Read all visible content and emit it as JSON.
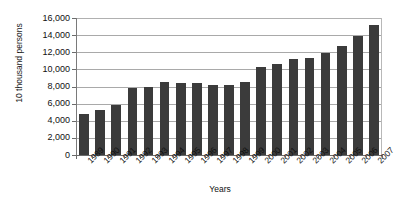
{
  "chart_data": {
    "type": "bar",
    "title": "",
    "xlabel": "Years",
    "ylabel": "10 thousand persons",
    "categories": [
      "1989",
      "1990",
      "1991",
      "1992",
      "1993",
      "1994",
      "1995",
      "1996",
      "1997",
      "1998",
      "1999",
      "2000",
      "2001",
      "2002",
      "2003",
      "2004",
      "2005",
      "2006",
      "2007"
    ],
    "values": [
      4800,
      5300,
      5800,
      7800,
      7900,
      8500,
      8400,
      8400,
      8200,
      8200,
      8500,
      10300,
      10600,
      11200,
      11300,
      11900,
      12700,
      13900,
      15200
    ],
    "ylim": [
      0,
      16000
    ],
    "ytick_labels": [
      "16,000",
      "14,000",
      "12,000",
      "10,000",
      "8,000",
      "6,000",
      "4,000",
      "2,000",
      "0"
    ],
    "ytick_values": [
      16000,
      14000,
      12000,
      10000,
      8000,
      6000,
      4000,
      2000,
      0
    ],
    "grid": true,
    "legend": "none",
    "series_color": "#3b3b3b",
    "grid_color": "#a9a9a9",
    "axis_color": "#6b6b6b"
  }
}
